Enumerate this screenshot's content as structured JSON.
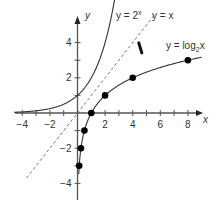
{
  "chart_data": {
    "type": "line",
    "title": "",
    "xlabel": "x",
    "ylabel": "y",
    "xlim": [
      -4.5,
      9
    ],
    "ylim": [
      -5,
      5.5
    ],
    "x_ticks": [
      -4,
      -3,
      -2,
      -1,
      0,
      1,
      2,
      3,
      4,
      5,
      6,
      7,
      8
    ],
    "x_tick_labels": [
      "-4",
      "-2",
      "2",
      "4",
      "6",
      "8"
    ],
    "x_tick_label_values": [
      -4,
      -2,
      2,
      4,
      6,
      8
    ],
    "y_ticks": [
      -4,
      -3,
      -2,
      -1,
      1,
      2,
      3,
      4
    ],
    "y_tick_labels": [
      "4",
      "2",
      "-2",
      "-4"
    ],
    "y_tick_label_values": [
      4,
      2,
      -2,
      -4
    ],
    "grid": false,
    "series": [
      {
        "name": "y = 2^x",
        "label": "y = 2",
        "label_sup": "x",
        "style": "solid",
        "function": "2^x",
        "domain": [
          -4.6,
          3.3
        ]
      },
      {
        "name": "y = x",
        "label": "y = x",
        "style": "dashed",
        "function": "x",
        "domain": [
          -3.7,
          5.6
        ]
      },
      {
        "name": "y = log2 x",
        "label": "y = log",
        "label_sub": "2",
        "label_tail": "x",
        "style": "solid",
        "function": "log2(x)",
        "domain": [
          0.09,
          9
        ],
        "points": [
          {
            "x": 0.125,
            "y": -3
          },
          {
            "x": 0.25,
            "y": -2
          },
          {
            "x": 0.5,
            "y": -1
          },
          {
            "x": 1,
            "y": 0
          },
          {
            "x": 2,
            "y": 1
          },
          {
            "x": 4,
            "y": 2
          },
          {
            "x": 8,
            "y": 3
          }
        ]
      }
    ],
    "annotations": [
      {
        "type": "reflection-mark",
        "description": "short thick bar across the line y = x indicating symmetry",
        "x": 4.55,
        "y": 3.7
      }
    ]
  },
  "colors": {
    "axis": "#555555",
    "curve": "#333333",
    "dashed": "#555555",
    "dot": "#000000"
  }
}
